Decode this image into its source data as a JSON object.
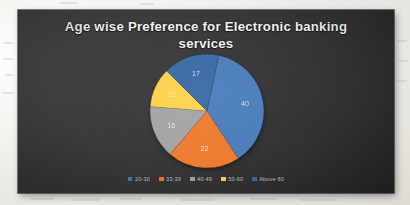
{
  "slide": {
    "background_color": "#3a3a3a",
    "title": "Age wise Preference for Electronic banking services"
  },
  "chart_data": {
    "type": "pie",
    "title": "Age wise Preference for Electronic banking services",
    "xlabel": "",
    "ylabel": "",
    "legend_position": "bottom",
    "grid": false,
    "categories": [
      "20-30",
      "33-39",
      "40-49",
      "50-60",
      "Above 60"
    ],
    "values": [
      40,
      22,
      16,
      12,
      17
    ],
    "data_labels": [
      "40",
      "22",
      "16",
      "12",
      "17"
    ],
    "colors": [
      "#4a7ebb",
      "#ed7d31",
      "#a5a5a5",
      "#ffd24d",
      "#3a6ba5"
    ],
    "start_angle_deg": 12,
    "series": [
      {
        "name": "Preference count",
        "values": [
          40,
          22,
          16,
          12,
          17
        ]
      }
    ]
  },
  "legend": {
    "items": [
      {
        "label": "20-30",
        "color": "#4a7ebb"
      },
      {
        "label": "33-39",
        "color": "#ed7d31"
      },
      {
        "label": "40-49",
        "color": "#a5a5a5"
      },
      {
        "label": "50-60",
        "color": "#ffd24d"
      },
      {
        "label": "Above 60",
        "color": "#3a6ba5"
      }
    ]
  }
}
